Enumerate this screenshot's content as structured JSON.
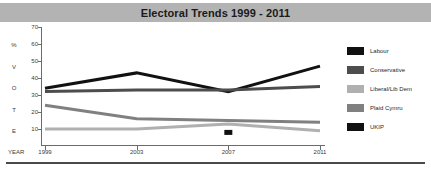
{
  "title": "Electoral Trends 1999 - 2011",
  "axis": {
    "y_caption_letters": [
      "%",
      "V",
      "O",
      "T",
      "E"
    ],
    "x_caption": "YEAR"
  },
  "legend": {
    "items": [
      {
        "label": "Labour",
        "color": "#111111"
      },
      {
        "label": "Conservative",
        "color": "#4d4d4d"
      },
      {
        "label": "Liberal/Lib Dem",
        "color": "#b0b0b0"
      },
      {
        "label": "Plaid Cymru",
        "color": "#808080"
      },
      {
        "label": "UKIP",
        "color": "#111111"
      }
    ]
  },
  "chart_data": {
    "type": "line",
    "title": "Electoral Trends 1999 - 2011",
    "xlabel": "YEAR",
    "ylabel": "% VOTE",
    "categories": [
      "1999",
      "2003",
      "2007",
      "2011"
    ],
    "x": [
      1999,
      2003,
      2007,
      2011
    ],
    "ylim": [
      0,
      70
    ],
    "yticks": [
      10,
      20,
      30,
      40,
      50,
      60,
      70
    ],
    "grid": false,
    "legend_position": "right",
    "series": [
      {
        "name": "Labour",
        "color": "#111111",
        "values": [
          34,
          43,
          32,
          47
        ]
      },
      {
        "name": "Conservative",
        "color": "#4d4d4d",
        "values": [
          32,
          33,
          33,
          35
        ]
      },
      {
        "name": "Plaid Cymru",
        "color": "#808080",
        "values": [
          24,
          16,
          15,
          14
        ]
      },
      {
        "name": "Liberal/Lib Dem",
        "color": "#b0b0b0",
        "values": [
          10,
          10,
          13,
          9
        ]
      },
      {
        "name": "UKIP",
        "color": "#111111",
        "values": [
          null,
          null,
          8,
          null
        ],
        "marker_only": true
      }
    ]
  }
}
